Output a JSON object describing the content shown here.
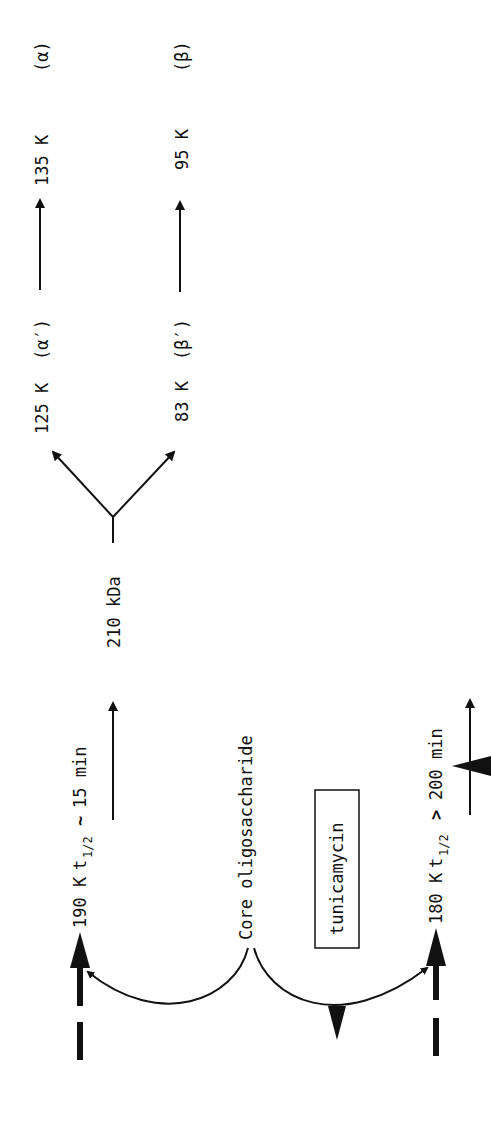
{
  "diagram": {
    "orientation": "rotated-90-ccw",
    "colors": {
      "ink": "#111111",
      "background": "#ffffff"
    },
    "precursors": {
      "glycosylated": {
        "label": "190 K",
        "t_label": "t",
        "t_sub": "1/2",
        "relation": "~",
        "time": "15 min"
      },
      "unglycosylated": {
        "label": "180 K",
        "t_label": "t",
        "t_sub": "1/2",
        "relation": ">",
        "time": "200 min"
      }
    },
    "core": {
      "label": "Core oligosaccharide"
    },
    "inhibitor": {
      "label": "tunicamycin"
    },
    "intermediate": {
      "label": "210 kDa"
    },
    "products": {
      "alpha_prime": {
        "label": "125 K",
        "greek": "(α′)"
      },
      "beta_prime": {
        "label": "83 K",
        "greek": "(β′)"
      },
      "alpha": {
        "label": "135 K",
        "greek": "(α)"
      },
      "beta": {
        "label": "95 K",
        "greek": "(β)"
      }
    }
  }
}
